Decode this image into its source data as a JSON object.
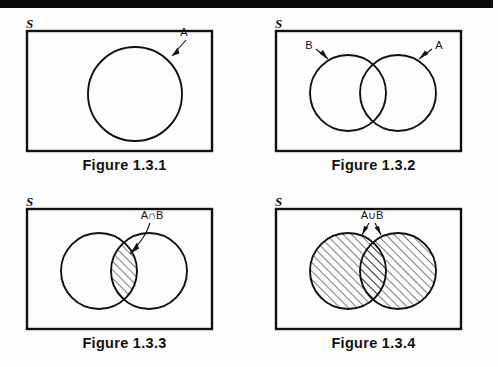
{
  "page": {
    "background_color": "#fdfdfb",
    "ink_color": "#111111",
    "top_rule_color": "#0a0a0a"
  },
  "panels": [
    {
      "id": "figure-1-3-1",
      "caption": "Figure 1.3.1",
      "universe_label": "S",
      "description": "Single circle A inside the sample space rectangle",
      "labels": [
        "A"
      ],
      "shaded_region": "none"
    },
    {
      "id": "figure-1-3-2",
      "caption": "Figure 1.3.2",
      "universe_label": "S",
      "description": "Two overlapping circles B and A inside the sample space rectangle",
      "labels": [
        "B",
        "A"
      ],
      "shaded_region": "none"
    },
    {
      "id": "figure-1-3-3",
      "caption": "Figure 1.3.3",
      "universe_label": "S",
      "description": "Two overlapping circles with the lens-shaped intersection hatched",
      "labels": [
        "A∩B"
      ],
      "shaded_region": "intersection"
    },
    {
      "id": "figure-1-3-4",
      "caption": "Figure 1.3.4",
      "universe_label": "S",
      "description": "Two overlapping circles with the entire union hatched",
      "labels": [
        "A∪B"
      ],
      "shaded_region": "union"
    }
  ]
}
